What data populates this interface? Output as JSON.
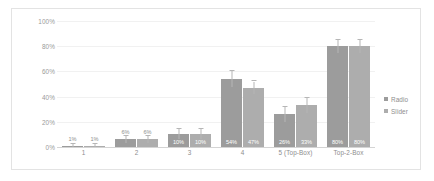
{
  "chart_data": {
    "type": "bar",
    "title": "",
    "subtitle": "",
    "xlabel": "",
    "ylabel": "",
    "ylim": [
      0,
      100
    ],
    "ytick_labels": [
      "100%",
      "80%",
      "60%",
      "40%",
      "20%",
      "0%"
    ],
    "ytick_values": [
      100,
      80,
      60,
      40,
      20,
      0
    ],
    "grid": true,
    "legend_position": "right",
    "categories": [
      "1",
      "2",
      "3",
      "4",
      "5 (Top-Box)",
      "Top-2-Box"
    ],
    "series": [
      {
        "name": "Radio",
        "color": "#9c9c9c",
        "values": [
          1,
          6,
          10,
          54,
          26,
          80
        ],
        "labels": [
          "1%",
          "6%",
          "10%",
          "54%",
          "26%",
          "80%"
        ],
        "err_low": [
          1,
          3,
          4,
          6,
          6,
          5
        ],
        "err_high": [
          1,
          3,
          4,
          6,
          6,
          5
        ]
      },
      {
        "name": "Slider",
        "color": "#adadad",
        "values": [
          1,
          6,
          10,
          47,
          33,
          80
        ],
        "labels": [
          "1%",
          "6%",
          "10%",
          "47%",
          "33%",
          "80%"
        ],
        "err_low": [
          1,
          3,
          4,
          5,
          6,
          5
        ],
        "err_high": [
          1,
          3,
          4,
          5,
          6,
          5
        ]
      }
    ]
  },
  "legend": {
    "items": [
      {
        "label": "Radio"
      },
      {
        "label": "Slider"
      }
    ]
  }
}
